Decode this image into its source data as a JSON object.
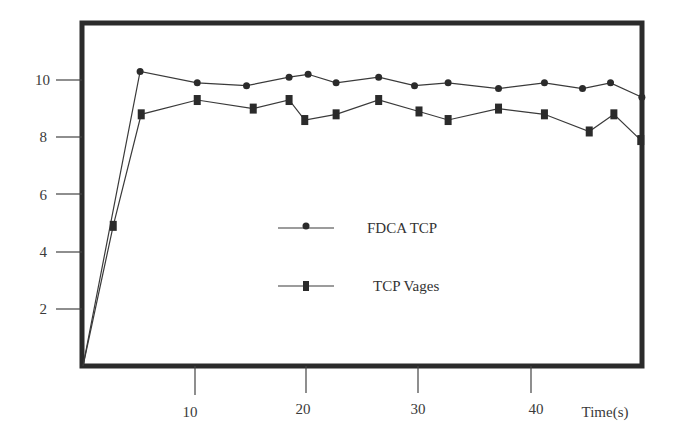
{
  "chart_data": {
    "type": "line",
    "title": "",
    "xlabel": "Time(s)",
    "ylabel": "",
    "xlim": [
      0,
      50
    ],
    "ylim": [
      0,
      12
    ],
    "x_ticks": [
      10,
      20,
      30,
      40
    ],
    "y_ticks": [
      2,
      4,
      6,
      8,
      10
    ],
    "grid": false,
    "legend_position": "center",
    "series": [
      {
        "name": "FDCA TCP",
        "marker": "circle",
        "x": [
          0,
          5.1,
          10.2,
          14.6,
          18.4,
          20.1,
          22.6,
          26.4,
          29.6,
          32.6,
          37.1,
          41.2,
          44.6,
          47.1,
          49.9
        ],
        "y": [
          0,
          10.3,
          9.9,
          9.8,
          10.1,
          10.2,
          9.9,
          10.1,
          9.8,
          9.9,
          9.7,
          9.9,
          9.7,
          9.9,
          9.4
        ]
      },
      {
        "name": "TCP Vages",
        "marker": "square",
        "x": [
          0,
          2.7,
          5.2,
          10.2,
          15.2,
          18.4,
          19.8,
          22.6,
          26.4,
          30.0,
          32.6,
          37.1,
          41.2,
          45.2,
          47.4,
          49.8
        ],
        "y": [
          0,
          4.9,
          8.8,
          9.3,
          9.0,
          9.3,
          8.6,
          8.8,
          9.3,
          8.9,
          8.6,
          9.0,
          8.8,
          8.2,
          8.8,
          7.9
        ]
      }
    ]
  },
  "axis": {
    "x_label": "Time(s)",
    "x_tick_labels": [
      "10",
      "20",
      "30",
      "40"
    ],
    "y_tick_labels": [
      "2",
      "4",
      "6",
      "8",
      "10"
    ]
  },
  "legend": {
    "items": [
      {
        "label": "FDCA TCP",
        "marker": "circle"
      },
      {
        "label": "TCP Vages",
        "marker": "square"
      }
    ]
  },
  "colors": {
    "frame": "#2b2b2b",
    "line": "#3a3a3a",
    "marker": "#2b2b2b",
    "background": "#ffffff"
  }
}
